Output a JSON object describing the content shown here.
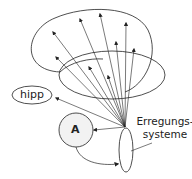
{
  "diagram": {
    "nodes": {
      "hipp": "hipp",
      "a": "A",
      "erregung_line1": "Erregungs-",
      "erregung_line2": "systeme"
    },
    "colors": {
      "stroke": "#222222",
      "fill_a": "#f2f2f2",
      "background": "#ffffff"
    }
  }
}
